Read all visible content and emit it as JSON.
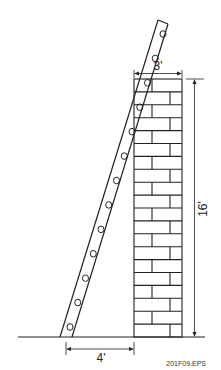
{
  "diagram": {
    "type": "ladder-against-wall",
    "labels": {
      "wall_width": "3'",
      "wall_height": "16'",
      "ladder_base_distance": "4'"
    },
    "caption": "201F09.EPS",
    "colors": {
      "line": "#222222",
      "background": "#ffffff"
    },
    "ladder": {
      "rungs": 13
    },
    "wall": {
      "courses": 20,
      "material": "brick"
    }
  }
}
